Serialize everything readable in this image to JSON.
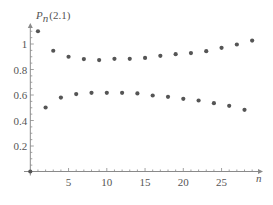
{
  "chart_data": {
    "type": "scatter",
    "title": "",
    "ylabel": "P_n(2.1)",
    "ylabel_parts": {
      "main": "P",
      "sub": "n",
      "arg": "(2.1)"
    },
    "xlabel": "n",
    "xlim": [
      0,
      30
    ],
    "ylim": [
      0,
      1.12
    ],
    "x_ticks": [
      5,
      10,
      15,
      20,
      25
    ],
    "y_ticks": [
      0.2,
      0.4,
      0.6,
      0.8,
      1
    ],
    "x_tick_labels": [
      "5",
      "10",
      "15",
      "20",
      "25"
    ],
    "y_tick_labels": [
      "0.2",
      "0.4",
      "0.6",
      "0.8",
      "1"
    ],
    "grid": false,
    "legend": null,
    "marker_color": "#555555",
    "axis_color": "#8a8a8a",
    "series": [
      {
        "name": "origin",
        "points": [
          [
            0,
            0
          ]
        ]
      },
      {
        "name": "odd n",
        "points": [
          [
            1,
            1.1
          ],
          [
            3,
            0.947
          ],
          [
            5,
            0.9
          ],
          [
            7,
            0.882
          ],
          [
            9,
            0.874
          ],
          [
            11,
            0.884
          ],
          [
            13,
            0.884
          ],
          [
            15,
            0.891
          ],
          [
            17,
            0.907
          ],
          [
            19,
            0.92
          ],
          [
            21,
            0.929
          ],
          [
            23,
            0.944
          ],
          [
            25,
            0.97
          ],
          [
            27,
            0.996
          ],
          [
            29,
            1.027
          ]
        ]
      },
      {
        "name": "even n",
        "points": [
          [
            2,
            0.502
          ],
          [
            4,
            0.58
          ],
          [
            6,
            0.607
          ],
          [
            8,
            0.617
          ],
          [
            10,
            0.617
          ],
          [
            12,
            0.617
          ],
          [
            14,
            0.612
          ],
          [
            16,
            0.596
          ],
          [
            18,
            0.586
          ],
          [
            20,
            0.57
          ],
          [
            22,
            0.557
          ],
          [
            24,
            0.536
          ],
          [
            26,
            0.515
          ],
          [
            28,
            0.484
          ]
        ]
      }
    ]
  }
}
